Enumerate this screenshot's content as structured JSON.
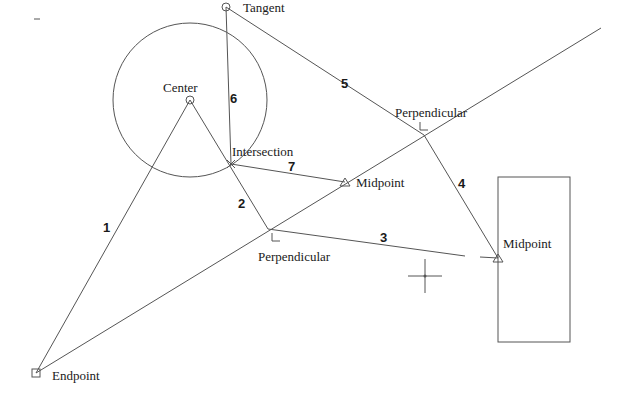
{
  "diagram": {
    "snap_labels": {
      "tangent": "Tangent",
      "center": "Center",
      "intersection": "Intersection",
      "perpendicular_top": "Perpendicular",
      "midpoint_inner": "Midpoint",
      "perpendicular_bottom": "Perpendicular",
      "midpoint_rect": "Midpoint",
      "endpoint": "Endpoint"
    },
    "segment_numbers": [
      "1",
      "2",
      "3",
      "4",
      "5",
      "6",
      "7"
    ],
    "colors": {
      "line": "#555555",
      "text": "#1a1a1a",
      "background": "#ffffff"
    }
  }
}
